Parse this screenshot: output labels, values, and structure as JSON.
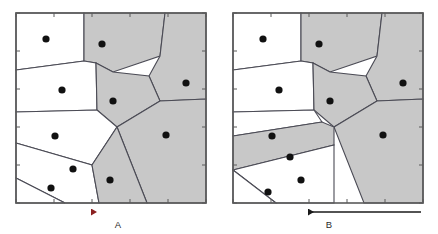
{
  "figure": {
    "type": "voronoi-diagram-pair",
    "width": 438,
    "height": 234,
    "background_color": "#ffffff"
  },
  "colors": {
    "shaded_cell_fill": "#c8c8c8",
    "unshaded_cell_fill": "#ffffff",
    "cell_edge": "#4b4b55",
    "panel_border": "#5a5a5a",
    "seed_point": "#111111",
    "arrow_a_head": "#8b2020",
    "arrow_a_tail": "#4a6e78",
    "arrow_b": "#1a1a1a",
    "label_text": "#2b2b2b"
  },
  "panels": [
    {
      "id": "panel-a",
      "label": "A",
      "frame": {
        "x": 16,
        "y": 13,
        "width": 190,
        "height": 190
      },
      "arrow": {
        "id": "arrow-a",
        "direction": "left",
        "x_start": 205,
        "x_end": 91,
        "y": 212,
        "gradient": true,
        "head_color": "#8b2020",
        "tail_color": "#4a6e78",
        "label": "A",
        "label_x": 118,
        "label_y": 228
      },
      "seed_points": [
        {
          "id": "a-p1",
          "x": 46,
          "y": 39,
          "shaded": false
        },
        {
          "id": "a-p2",
          "x": 102,
          "y": 44,
          "shaded": true
        },
        {
          "id": "a-p3",
          "x": 62,
          "y": 90,
          "shaded": false
        },
        {
          "id": "a-p4",
          "x": 186,
          "y": 83,
          "shaded": true
        },
        {
          "id": "a-p5",
          "x": 113,
          "y": 101,
          "shaded": true
        },
        {
          "id": "a-p6",
          "x": 55,
          "y": 136,
          "shaded": false
        },
        {
          "id": "a-p7",
          "x": 166,
          "y": 135,
          "shaded": true
        },
        {
          "id": "a-p8",
          "x": 73,
          "y": 169,
          "shaded": false
        },
        {
          "id": "a-p9",
          "x": 110,
          "y": 180,
          "shaded": true
        },
        {
          "id": "a-p10",
          "x": 51,
          "y": 188,
          "shaded": false
        }
      ],
      "cells": [
        {
          "id": "a-c1",
          "seed": "a-p1",
          "shaded": false,
          "points": "16,13 84,13 84,61 16,70"
        },
        {
          "id": "a-c2",
          "seed": "a-p2",
          "shaded": true,
          "points": "84,13 165,13 160,56 113,72 96,63 84,61"
        },
        {
          "id": "a-c3",
          "seed": "a-p3",
          "shaded": false,
          "points": "16,70 84,61 96,63 97,110 16,112"
        },
        {
          "id": "a-c4",
          "seed": "a-p4",
          "shaded": true,
          "points": "165,13 206,13 206,99 160,101 149,76 160,56"
        },
        {
          "id": "a-c5",
          "seed": "a-p5",
          "shaded": true,
          "points": "96,63 113,72 149,76 160,101 117,127 97,110"
        },
        {
          "id": "a-c6",
          "seed": "a-p6",
          "shaded": false,
          "points": "16,112 97,110 117,127 92,165 16,143"
        },
        {
          "id": "a-c7",
          "seed": "a-p7",
          "shaded": true,
          "points": "160,101 206,99 206,203 147,203 117,127"
        },
        {
          "id": "a-c8",
          "seed": "a-p8",
          "shaded": false,
          "points": "16,143 92,165 99,203 65,203 16,178"
        },
        {
          "id": "a-c9",
          "seed": "a-p9",
          "shaded": true,
          "points": "92,165 117,127 147,203 99,203"
        },
        {
          "id": "a-c10",
          "seed": "a-p10",
          "shaded": false,
          "points": "16,178 65,203 16,203"
        }
      ],
      "shaded_count": 5,
      "unshaded_count": 5
    },
    {
      "id": "panel-b",
      "label": "B",
      "frame": {
        "x": 233,
        "y": 13,
        "width": 190,
        "height": 190
      },
      "arrow": {
        "id": "arrow-b",
        "direction": "left",
        "x_start": 421,
        "x_end": 308,
        "y": 212,
        "gradient": false,
        "head_color": "#1a1a1a",
        "tail_color": "#1a1a1a",
        "label": "B",
        "label_x": 329,
        "label_y": 228
      },
      "seed_points": [
        {
          "id": "b-p1",
          "x": 263,
          "y": 39,
          "shaded": false
        },
        {
          "id": "b-p2",
          "x": 319,
          "y": 44,
          "shaded": true
        },
        {
          "id": "b-p3",
          "x": 279,
          "y": 90,
          "shaded": false
        },
        {
          "id": "b-p4",
          "x": 403,
          "y": 83,
          "shaded": true
        },
        {
          "id": "b-p5",
          "x": 330,
          "y": 101,
          "shaded": true
        },
        {
          "id": "b-p6",
          "x": 272,
          "y": 136,
          "shaded": false
        },
        {
          "id": "b-p7",
          "x": 383,
          "y": 135,
          "shaded": true
        },
        {
          "id": "b-p8",
          "x": 290,
          "y": 157,
          "shaded": true
        },
        {
          "id": "b-p9",
          "x": 301,
          "y": 180,
          "shaded": false
        },
        {
          "id": "b-p10",
          "x": 268,
          "y": 192,
          "shaded": false
        }
      ],
      "cells": [
        {
          "id": "b-c1",
          "seed": "b-p1",
          "shaded": false,
          "points": "233,13 301,13 301,61 233,70"
        },
        {
          "id": "b-c2",
          "seed": "b-p2",
          "shaded": true,
          "points": "301,13 382,13 377,56 330,72 313,63 301,61"
        },
        {
          "id": "b-c3",
          "seed": "b-p3",
          "shaded": false,
          "points": "233,70 301,61 313,63 314,110 233,112"
        },
        {
          "id": "b-c4",
          "seed": "b-p4",
          "shaded": true,
          "points": "382,13 423,13 423,99 377,101 366,76 377,56"
        },
        {
          "id": "b-c5",
          "seed": "b-p5",
          "shaded": true,
          "points": "313,63 330,72 366,76 377,101 334,127 314,110"
        },
        {
          "id": "b-c6",
          "seed": "b-p6",
          "shaded": false,
          "points": "233,112 314,110 322,122 233,136"
        },
        {
          "id": "b-c7",
          "seed": "b-p7",
          "shaded": true,
          "points": "377,101 423,99 423,203 364,203 334,127"
        },
        {
          "id": "b-c8",
          "seed": "b-p8",
          "shaded": true,
          "points": "233,136 322,122 334,127 334,145 233,170"
        },
        {
          "id": "b-c9",
          "seed": "b-p9",
          "shaded": false,
          "points": "233,170 334,145 334,203 276,203"
        },
        {
          "id": "b-c10",
          "seed": "b-p10",
          "shaded": false,
          "points": "233,170 276,203 233,203"
        }
      ],
      "shaded_count": 5,
      "unshaded_count": 5
    }
  ],
  "chart_data": {
    "type": "scatter",
    "title": "",
    "xlabel": "",
    "ylabel": "",
    "grid": false,
    "legend": null,
    "annotations": [
      "A",
      "B"
    ],
    "panel_labels": [
      "A",
      "B"
    ],
    "series": [
      {
        "name": "A",
        "x": [
          46,
          102,
          62,
          186,
          113,
          55,
          166,
          73,
          110,
          51
        ],
        "y": [
          39,
          44,
          90,
          83,
          101,
          136,
          135,
          169,
          180,
          188
        ],
        "shaded": [
          false,
          true,
          false,
          true,
          true,
          false,
          true,
          false,
          true,
          false
        ]
      },
      {
        "name": "B",
        "x": [
          263,
          319,
          279,
          403,
          330,
          272,
          383,
          290,
          301,
          268
        ],
        "y": [
          39,
          44,
          90,
          83,
          101,
          136,
          135,
          157,
          180,
          192
        ],
        "shaded": [
          false,
          true,
          false,
          true,
          true,
          false,
          true,
          true,
          false,
          false
        ]
      }
    ]
  }
}
